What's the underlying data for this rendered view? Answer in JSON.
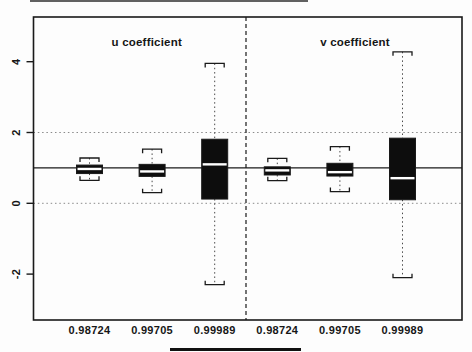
{
  "figure": {
    "background": "#fdfdfd",
    "ink_color": "#1a1a1a",
    "grid_color": "#8a8a8a",
    "box_fill": "#0d0d0d",
    "median_color": "#ffffff"
  },
  "chart_data": {
    "type": "boxplot",
    "title": "",
    "xlabel": "",
    "ylabel": "",
    "y_axis": {
      "ticks": [
        4,
        2,
        0,
        -2
      ],
      "tick_labels": [
        "4",
        "2",
        "0",
        "-2"
      ],
      "range": [
        -3.3,
        5.3
      ],
      "dotted_gridlines": [
        2,
        0
      ],
      "solid_reference_line": 1
    },
    "panel_divider_style": "dashed",
    "panels": [
      {
        "label": "u coefficient",
        "categories": [
          "0.98724",
          "0.99705",
          "0.99989"
        ],
        "boxes": [
          {
            "category": "0.98724",
            "whisker_low": 0.65,
            "q1": 0.84,
            "median": 0.97,
            "q3": 1.08,
            "whisker_high": 1.28
          },
          {
            "category": "0.99705",
            "whisker_low": 0.3,
            "q1": 0.76,
            "median": 0.9,
            "q3": 1.1,
            "whisker_high": 1.53
          },
          {
            "category": "0.99989",
            "whisker_low": -2.3,
            "q1": 0.12,
            "median": 1.1,
            "q3": 1.81,
            "whisker_high": 3.95
          }
        ]
      },
      {
        "label": "v coefficient",
        "categories": [
          "0.98724",
          "0.99705",
          "0.99989"
        ],
        "boxes": [
          {
            "category": "0.98724",
            "whisker_low": 0.64,
            "q1": 0.8,
            "median": 0.93,
            "q3": 1.03,
            "whisker_high": 1.27
          },
          {
            "category": "0.99705",
            "whisker_low": 0.33,
            "q1": 0.77,
            "median": 0.88,
            "q3": 1.13,
            "whisker_high": 1.6
          },
          {
            "category": "0.99989",
            "whisker_low": -2.1,
            "q1": 0.1,
            "median": 0.71,
            "q3": 1.84,
            "whisker_high": 4.28
          }
        ]
      }
    ]
  }
}
